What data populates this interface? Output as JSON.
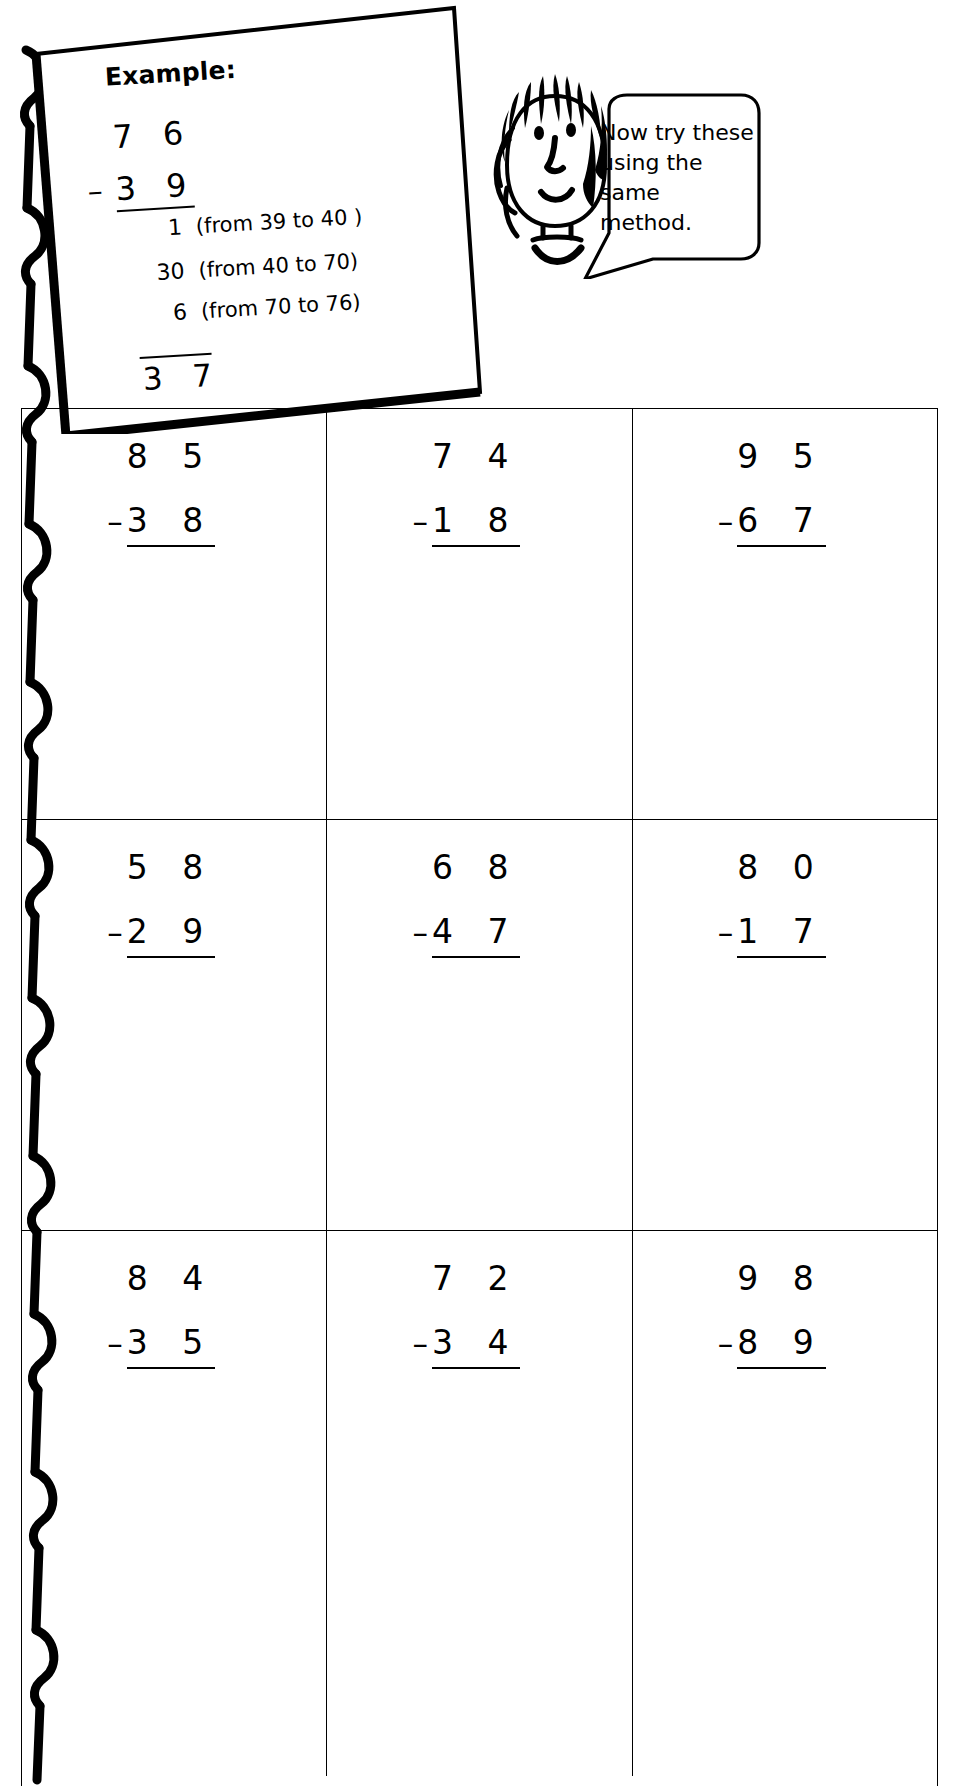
{
  "worksheet": {
    "background_color": "#ffffff",
    "ink_color": "#000000"
  },
  "example": {
    "title": "Example:",
    "minuend": "7 6",
    "operator": "–",
    "subtrahend": "3 9",
    "steps": [
      {
        "value": "1",
        "note": "(from 39 to 40 )"
      },
      {
        "value": "30",
        "note": "(from 40 to 70)"
      },
      {
        "value": "6",
        "note": "(from 70 to 76)"
      }
    ],
    "answer": "3 7"
  },
  "character": {
    "name": "girl-cartoon-head",
    "speech": "Now try these using the same method."
  },
  "problems": {
    "rows": [
      [
        {
          "minuend": "8 5",
          "operator": "–",
          "subtrahend": "3 8"
        },
        {
          "minuend": "7 4",
          "operator": "–",
          "subtrahend": "1 8"
        },
        {
          "minuend": "9 5",
          "operator": "–",
          "subtrahend": "6 7"
        }
      ],
      [
        {
          "minuend": "5 8",
          "operator": "–",
          "subtrahend": "2 9"
        },
        {
          "minuend": "6 8",
          "operator": "–",
          "subtrahend": "4 7"
        },
        {
          "minuend": "8 0",
          "operator": "–",
          "subtrahend": "1 7"
        }
      ],
      [
        {
          "minuend": "8 4",
          "operator": "–",
          "subtrahend": "3 5"
        },
        {
          "minuend": "7 2",
          "operator": "–",
          "subtrahend": "3 4"
        },
        {
          "minuend": "9 8",
          "operator": "–",
          "subtrahend": "8 9"
        }
      ]
    ]
  }
}
